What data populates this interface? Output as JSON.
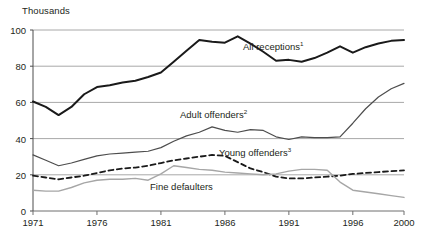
{
  "chart_data": {
    "type": "line",
    "title": "",
    "subtitle": "",
    "unit_label": "Thousands",
    "xlabel": "",
    "ylabel": "Thousands",
    "xlim": [
      1971,
      2000
    ],
    "ylim": [
      0,
      100
    ],
    "yticks": [
      0,
      20,
      40,
      60,
      80,
      100
    ],
    "xticks": [
      1971,
      1976,
      1981,
      1986,
      1991,
      1996,
      2000
    ],
    "grid": "horizontal",
    "legend_position": "inline-annotations",
    "x": [
      1971,
      1972,
      1973,
      1974,
      1975,
      1976,
      1977,
      1978,
      1979,
      1980,
      1981,
      1982,
      1983,
      1984,
      1985,
      1986,
      1987,
      1988,
      1989,
      1990,
      1991,
      1992,
      1993,
      1994,
      1995,
      1996,
      1997,
      1998,
      1999,
      2000
    ],
    "series": [
      {
        "name": "All receptions",
        "footnote": "1",
        "style": "solid",
        "color": "#1a1a1a",
        "width": 2.0,
        "values": [
          60.5,
          57.5,
          53.0,
          57.5,
          64.5,
          68.5,
          69.5,
          71.0,
          72.0,
          74.0,
          76.5,
          82.5,
          88.5,
          94.5,
          93.5,
          93.0,
          96.5,
          92.5,
          88.0,
          83.0,
          83.5,
          82.5,
          84.5,
          87.5,
          91.0,
          87.5,
          90.5,
          92.5,
          94.0,
          94.5
        ]
      },
      {
        "name": "Adult offenders",
        "footnote": "2",
        "style": "solid",
        "color": "#4d4d4d",
        "width": 1.2,
        "values": [
          31.0,
          28.0,
          25.0,
          26.5,
          28.5,
          30.5,
          31.5,
          32.0,
          32.5,
          33.0,
          35.0,
          38.5,
          41.5,
          43.5,
          46.5,
          44.5,
          43.5,
          45.0,
          44.5,
          41.0,
          39.5,
          41.0,
          40.5,
          40.5,
          41.0,
          48.5,
          56.5,
          63.0,
          67.5,
          70.5
        ]
      },
      {
        "name": "Young offenders",
        "footnote": "3",
        "style": "dashed",
        "color": "#1a1a1a",
        "width": 1.8,
        "values": [
          19.5,
          18.5,
          17.5,
          18.5,
          19.5,
          21.0,
          22.5,
          23.5,
          24.0,
          25.0,
          26.5,
          28.0,
          29.0,
          30.0,
          31.0,
          30.5,
          27.0,
          23.5,
          21.5,
          19.0,
          18.0,
          18.0,
          18.5,
          19.0,
          19.5,
          20.5,
          21.0,
          21.5,
          22.0,
          22.5
        ]
      },
      {
        "name": "Fine defaulters",
        "footnote": "",
        "style": "solid",
        "color": "#a6a6a6",
        "width": 1.4,
        "values": [
          11.5,
          11.0,
          11.0,
          13.0,
          15.5,
          17.0,
          17.5,
          17.5,
          18.0,
          17.0,
          20.5,
          25.0,
          24.0,
          23.0,
          22.5,
          21.5,
          21.0,
          20.5,
          20.0,
          20.5,
          22.0,
          23.0,
          23.0,
          22.5,
          16.0,
          11.5,
          10.5,
          9.5,
          8.5,
          7.5
        ]
      }
    ],
    "annotations": [
      {
        "id": "all-receptions-label",
        "text": "All receptions",
        "footnote": "1",
        "x_px": 243,
        "y_px": 46
      },
      {
        "id": "adult-offenders-label",
        "text": "Adult offenders",
        "footnote": "2",
        "x_px": 180,
        "y_px": 114
      },
      {
        "id": "young-offenders-label",
        "text": "Young offenders",
        "footnote": "3",
        "x_px": 219,
        "y_px": 152
      },
      {
        "id": "fine-defaulters-label",
        "text": "Fine defaulters",
        "footnote": "",
        "x_px": 150,
        "y_px": 187
      }
    ]
  }
}
